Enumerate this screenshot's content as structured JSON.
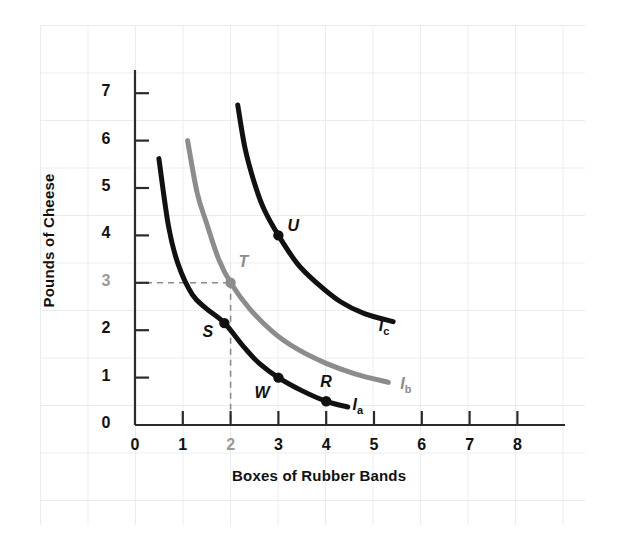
{
  "chart_data": {
    "type": "line",
    "title": "",
    "xlabel": "Boxes of Rubber Bands",
    "ylabel": "Pounds of Cheese",
    "xlim": [
      0,
      8.6
    ],
    "ylim": [
      0,
      7.6
    ],
    "xticks": [
      "0",
      "1",
      "2",
      "3",
      "4",
      "5",
      "6",
      "7",
      "8"
    ],
    "xtick_values": [
      0,
      1,
      2,
      3,
      4,
      5,
      6,
      7,
      8
    ],
    "yticks": [
      "0",
      "1",
      "2",
      "3",
      "4",
      "5",
      "6",
      "7"
    ],
    "ytick_values": [
      0,
      1,
      2,
      3,
      4,
      5,
      6,
      7
    ],
    "grid": true,
    "grid_style": "faint graph paper",
    "legend_position": "inline curve end labels",
    "highlight_color": "#8c8c8c",
    "curve_color": "#111111",
    "series": [
      {
        "name": "I_a",
        "label": "I",
        "label_sub": "a",
        "color": "#111111",
        "label_x": 4.55,
        "label_y": 0.38,
        "points": [
          {
            "x": 0.5,
            "y": 5.62
          },
          {
            "x": 0.7,
            "y": 4.2
          },
          {
            "x": 0.9,
            "y": 3.4
          },
          {
            "x": 1.2,
            "y": 2.75
          },
          {
            "x": 1.5,
            "y": 2.45
          },
          {
            "x": 1.87,
            "y": 2.15
          },
          {
            "x": 2.3,
            "y": 1.62
          },
          {
            "x": 2.6,
            "y": 1.3
          },
          {
            "x": 3.0,
            "y": 1.0
          },
          {
            "x": 3.5,
            "y": 0.72
          },
          {
            "x": 4.0,
            "y": 0.5
          },
          {
            "x": 4.45,
            "y": 0.38
          }
        ]
      },
      {
        "name": "I_b",
        "label": "I",
        "label_sub": "b",
        "color": "#8c8c8c",
        "label_x": 5.55,
        "label_y": 0.82,
        "points": [
          {
            "x": 1.1,
            "y": 6.0
          },
          {
            "x": 1.3,
            "y": 4.9
          },
          {
            "x": 1.5,
            "y": 4.25
          },
          {
            "x": 1.75,
            "y": 3.5
          },
          {
            "x": 2.0,
            "y": 3.0
          },
          {
            "x": 2.4,
            "y": 2.45
          },
          {
            "x": 2.9,
            "y": 1.95
          },
          {
            "x": 3.4,
            "y": 1.6
          },
          {
            "x": 4.0,
            "y": 1.3
          },
          {
            "x": 4.6,
            "y": 1.08
          },
          {
            "x": 5.3,
            "y": 0.9
          }
        ]
      },
      {
        "name": "I_c",
        "label": "I",
        "label_sub": "c",
        "color": "#111111",
        "label_x": 5.1,
        "label_y": 2.05,
        "points": [
          {
            "x": 2.15,
            "y": 6.75
          },
          {
            "x": 2.3,
            "y": 5.85
          },
          {
            "x": 2.5,
            "y": 5.1
          },
          {
            "x": 2.7,
            "y": 4.55
          },
          {
            "x": 3.0,
            "y": 4.0
          },
          {
            "x": 3.4,
            "y": 3.4
          },
          {
            "x": 3.8,
            "y": 3.0
          },
          {
            "x": 4.3,
            "y": 2.6
          },
          {
            "x": 4.8,
            "y": 2.35
          },
          {
            "x": 5.4,
            "y": 2.18
          }
        ]
      }
    ],
    "points": [
      {
        "name": "S",
        "x": 1.87,
        "y": 2.15,
        "label": "S",
        "color": "#111111",
        "label_dx": -22,
        "label_dy": 8
      },
      {
        "name": "W",
        "x": 3.0,
        "y": 1.0,
        "label": "W",
        "color": "#111111",
        "label_dx": -24,
        "label_dy": 14
      },
      {
        "name": "R",
        "x": 4.0,
        "y": 0.5,
        "label": "R",
        "color": "#111111",
        "label_dx": -6,
        "label_dy": -20
      },
      {
        "name": "T",
        "x": 2.0,
        "y": 3.0,
        "label": "T",
        "color": "#8c8c8c",
        "label_dx": 8,
        "label_dy": -22
      },
      {
        "name": "U",
        "x": 3.0,
        "y": 4.0,
        "label": "U",
        "color": "#111111",
        "label_dx": 9,
        "label_dy": -10
      }
    ],
    "annotations": [
      {
        "type": "dashed-guide",
        "from": {
          "x": 0,
          "y": 3
        },
        "to": {
          "x": 2,
          "y": 3
        },
        "color": "#8c8c8c"
      },
      {
        "type": "dashed-guide",
        "from": {
          "x": 2,
          "y": 3
        },
        "to": {
          "x": 2,
          "y": 0
        },
        "color": "#8c8c8c"
      }
    ]
  }
}
